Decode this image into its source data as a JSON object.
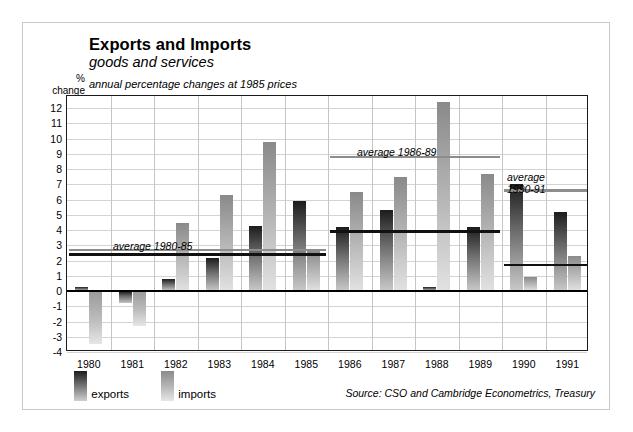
{
  "figure": {
    "title": "Exports and Imports",
    "subtitle": "goods and services",
    "note": "annual percentage changes at 1985 prices",
    "axis_caption_line1": "%",
    "axis_caption_line2": "change",
    "source": "Source: CSO and Cambridge Econometrics, Treasury"
  },
  "legend": {
    "exports_label": "exports",
    "imports_label": "imports"
  },
  "chart_data": {
    "type": "bar",
    "title": "Exports and Imports",
    "subtitle": "goods and services",
    "annotation": "annual percentage changes at 1985 prices",
    "xlabel": "",
    "ylabel": "% change",
    "ylim": [
      -4,
      12.8
    ],
    "yticks": [
      12,
      11,
      10,
      9,
      8,
      7,
      6,
      5,
      4,
      3,
      2,
      1,
      0,
      -1,
      -2,
      -3,
      -4
    ],
    "grid": true,
    "legend_position": "below-left",
    "categories": [
      "1980",
      "1981",
      "1982",
      "1983",
      "1984",
      "1985",
      "1986",
      "1987",
      "1988",
      "1989",
      "1990",
      "1991"
    ],
    "series": [
      {
        "name": "exports",
        "color": "#3a3a3a",
        "values": [
          0.3,
          -0.8,
          0.8,
          2.2,
          4.3,
          5.9,
          4.2,
          5.3,
          0.3,
          4.2,
          7.0,
          5.2
        ]
      },
      {
        "name": "imports",
        "color": "#b0b0b0",
        "values": [
          -3.5,
          -2.3,
          4.5,
          6.3,
          9.8,
          2.6,
          6.5,
          7.5,
          12.4,
          7.7,
          0.9,
          2.3
        ]
      }
    ],
    "averages": [
      {
        "label": "average 1980-85",
        "series": "exports",
        "value": 2.4,
        "start_category": "1980",
        "end_category": "1985"
      },
      {
        "label": "average 1980-85",
        "series": "imports",
        "value": 2.7,
        "start_category": "1980",
        "end_category": "1985"
      },
      {
        "label": "average 1986-89",
        "series": "exports",
        "value": 3.9,
        "start_category": "1986",
        "end_category": "1989"
      },
      {
        "label": "average 1986-89",
        "series": "imports",
        "value": 8.8,
        "start_category": "1986",
        "end_category": "1989"
      },
      {
        "label": "average 1990-91",
        "series": "exports",
        "value": 1.7,
        "start_category": "1990",
        "end_category": "1991"
      },
      {
        "label": "average 1990-91",
        "series": "imports",
        "value": 6.6,
        "start_category": "1990",
        "end_category": "1991"
      }
    ],
    "average_labels": [
      {
        "text": "average 1980-85"
      },
      {
        "text": "average 1986-89"
      },
      {
        "text": "average",
        "text2": "1990-91"
      }
    ]
  }
}
